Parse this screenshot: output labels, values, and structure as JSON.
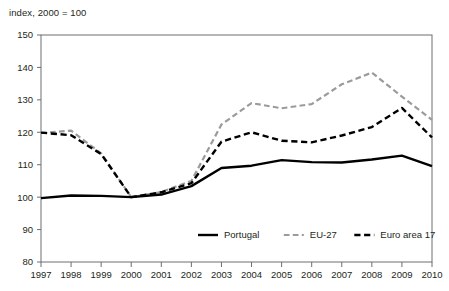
{
  "chart_data": {
    "type": "line",
    "title": "",
    "subtitle": "index, 2000 = 100",
    "xlabel": "",
    "ylabel": "",
    "x": [
      1997,
      1998,
      1999,
      2000,
      2001,
      2002,
      2003,
      2004,
      2005,
      2006,
      2007,
      2008,
      2009,
      2010
    ],
    "categories": [
      "1997",
      "1998",
      "1999",
      "2000",
      "2001",
      "2002",
      "2003",
      "2004",
      "2005",
      "2006",
      "2007",
      "2008",
      "2009",
      "2010"
    ],
    "xlim": [
      1997,
      2010
    ],
    "ylim": [
      80,
      150
    ],
    "yticks": [
      80,
      90,
      100,
      110,
      120,
      130,
      140,
      150
    ],
    "ytick_labels": [
      "80",
      "90",
      "100",
      "110",
      "120",
      "130",
      "140",
      "150"
    ],
    "grid": false,
    "legend_position": "inside-bottom-center",
    "series": [
      {
        "name": "Portugal",
        "color": "#000000",
        "style": "solid",
        "width": 2.4,
        "values": [
          99.7,
          100.5,
          100.4,
          100.0,
          100.8,
          103.4,
          109.0,
          109.7,
          111.4,
          110.8,
          110.7,
          111.6,
          112.8,
          109.6
        ]
      },
      {
        "name": "EU-27",
        "color": "#9b9b9b",
        "style": "dashed",
        "width": 2.2,
        "values": [
          119.8,
          120.5,
          113.5,
          100.0,
          101.6,
          105.0,
          122.4,
          129.0,
          127.4,
          128.7,
          134.8,
          138.4,
          131.0,
          123.8
        ]
      },
      {
        "name": "Euro area 17",
        "color": "#000000",
        "style": "dashed",
        "width": 2.4,
        "values": [
          119.9,
          119.1,
          113.3,
          100.0,
          101.5,
          104.3,
          117.1,
          120.0,
          117.4,
          116.9,
          119.0,
          121.6,
          127.5,
          118.4
        ]
      }
    ]
  },
  "axes": {
    "axis_color": "#6d6e70",
    "text_color": "#231f20"
  }
}
